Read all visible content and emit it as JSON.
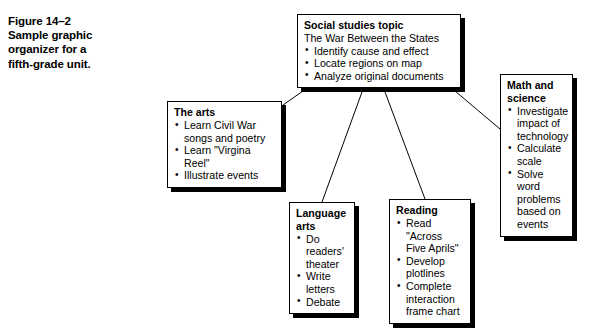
{
  "figure": {
    "caption_lines": [
      "Figure 14–2",
      "Sample graphic",
      "organizer for a",
      "fifth-grade unit."
    ]
  },
  "diagram": {
    "center": {
      "title": "Social studies topic",
      "subtitle": "The War Between the States",
      "items": [
        "Identify cause and effect",
        "Locate regions on map",
        "Analyze original documents"
      ],
      "bullet": "•"
    },
    "branches": [
      {
        "id": "arts",
        "title": "The arts",
        "items": [
          "Learn Civil War\nsongs and poetry",
          "Learn \"Virgina\nReel\"",
          "Illustrate events"
        ]
      },
      {
        "id": "math",
        "title": "Math and\nscience",
        "items": [
          "Investigate\nimpact of\ntechnology",
          "Calculate\nscale",
          "Solve word\nproblems\nbased on\nevents"
        ]
      },
      {
        "id": "language",
        "title": "Language\narts",
        "items": [
          "Do\nreaders'\ntheater",
          "Write\nletters",
          "Debate"
        ]
      },
      {
        "id": "reading",
        "title": "Reading",
        "items": [
          "Read \"Across\nFive Aprils\"",
          "Develop\nplotlines",
          "Complete\ninteraction\nframe chart"
        ]
      }
    ],
    "colors": {
      "line": "#000000",
      "box_border": "#000000",
      "box_fill": "#ffffff",
      "shadow": "#000000",
      "text": "#000000"
    }
  }
}
